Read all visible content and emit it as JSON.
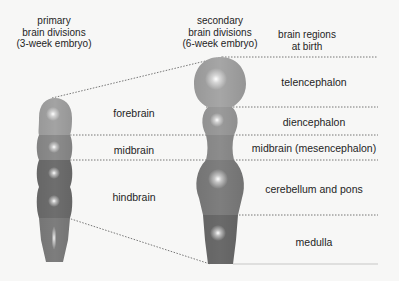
{
  "headers": {
    "primary": [
      "primary",
      "brain divisions",
      "(3-week embryo)"
    ],
    "secondary": [
      "secondary",
      "brain divisions",
      "(6-week embryo)"
    ],
    "regions": [
      "brain regions",
      "at birth"
    ]
  },
  "primary_divisions": [
    {
      "label": "forebrain"
    },
    {
      "label": "midbrain"
    },
    {
      "label": "hindbrain"
    }
  ],
  "birth_regions": [
    {
      "label": "telencephalon"
    },
    {
      "label": "diencephalon"
    },
    {
      "label": "midbrain (mesencephalon)"
    },
    {
      "label": "cerebellum and pons"
    },
    {
      "label": "medulla"
    }
  ],
  "colors": {
    "background": "#f7f7f6",
    "forebrain_light": "#a3a3a3",
    "midbrain_mid": "#8c8c8c",
    "hindbrain_dark": "#6e6e6e",
    "medulla_mid": "#7d7d7d",
    "dashed_line": "#555555"
  }
}
